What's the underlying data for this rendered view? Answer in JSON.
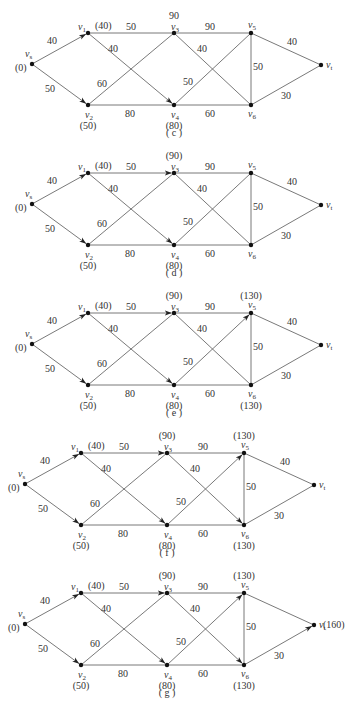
{
  "figure": {
    "node_names": {
      "vs": {
        "base": "v",
        "sub": "s"
      },
      "v1": {
        "base": "v",
        "sub": "1"
      },
      "v2": {
        "base": "v",
        "sub": "2"
      },
      "v3": {
        "base": "v",
        "sub": "3"
      },
      "v4": {
        "base": "v",
        "sub": "4"
      },
      "v5": {
        "base": "v",
        "sub": "5"
      },
      "v6": {
        "base": "v",
        "sub": "6"
      },
      "vt": {
        "base": "v",
        "sub": "t"
      }
    },
    "edges": [
      {
        "from": "vs",
        "to": "v1",
        "weight": "40"
      },
      {
        "from": "vs",
        "to": "v2",
        "weight": "50"
      },
      {
        "from": "v1",
        "to": "v3",
        "weight": "50"
      },
      {
        "from": "v1",
        "to": "v4",
        "weight": "40"
      },
      {
        "from": "v2",
        "to": "v3",
        "weight": "60"
      },
      {
        "from": "v2",
        "to": "v4",
        "weight": "80"
      },
      {
        "from": "v3",
        "to": "v5",
        "weight": "90"
      },
      {
        "from": "v3",
        "to": "v6",
        "weight": "40"
      },
      {
        "from": "v4",
        "to": "v5",
        "weight": "50"
      },
      {
        "from": "v4",
        "to": "v6",
        "weight": "60"
      },
      {
        "from": "v5",
        "to": "v6",
        "weight": "50"
      },
      {
        "from": "v5",
        "to": "vt",
        "weight": "40"
      },
      {
        "from": "v6",
        "to": "vt",
        "weight": "30"
      }
    ],
    "panels": [
      {
        "caption": "( c )",
        "offset": [
          0,
          0
        ],
        "labels": {
          "vs": "(0)",
          "v1": "(40)",
          "v2": "(50)",
          "v3": "90",
          "v4": "(80)"
        },
        "arrows": [
          "vs-v1",
          "vs-v2",
          "v1-v4"
        ],
        "hidden_weights": []
      },
      {
        "caption": "( d )",
        "offset": [
          0,
          140
        ],
        "labels": {
          "vs": "(0)",
          "v1": "(40)",
          "v2": "(50)",
          "v3": "(90)",
          "v4": "(80)"
        },
        "arrows": [
          "vs-v1",
          "vs-v2",
          "v1-v4",
          "v1-v3"
        ],
        "hidden_weights": []
      },
      {
        "caption": "( e )",
        "offset": [
          0,
          280
        ],
        "labels": {
          "vs": "(0)",
          "v1": "(40)",
          "v2": "(50)",
          "v3": "(90)",
          "v4": "(80)",
          "v5": "(130)",
          "v6": "(130)"
        },
        "arrows": [
          "vs-v1",
          "vs-v2",
          "v1-v4",
          "v1-v3",
          "v4-v5"
        ],
        "hidden_weights": []
      },
      {
        "caption": "( f )",
        "offset": [
          -7,
          420
        ],
        "labels": {
          "vs": "(0)",
          "v1": "(40)",
          "v2": "(50)",
          "v3": "(90)",
          "v4": "(80)",
          "v5": "(130)",
          "v6": "(130)"
        },
        "arrows": [
          "vs-v1",
          "vs-v2",
          "v1-v4",
          "v1-v3",
          "v4-v5",
          "v3-v6"
        ],
        "hidden_weights": []
      },
      {
        "caption": "( g )",
        "offset": [
          -7,
          560
        ],
        "labels": {
          "vs": "(0)",
          "v1": "(40)",
          "v2": "(50)",
          "v3": "(90)",
          "v4": "(80)",
          "v5": "(130)",
          "v6": "(130)",
          "vt": "(160)"
        },
        "arrows": [
          "vs-v1",
          "vs-v2",
          "v1-v4",
          "v1-v3",
          "v4-v5",
          "v3-v6",
          "v6-vt"
        ],
        "hidden_weights": [
          "v5-vt"
        ]
      }
    ]
  }
}
